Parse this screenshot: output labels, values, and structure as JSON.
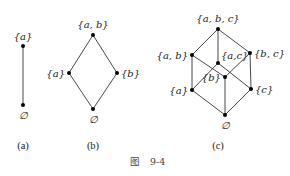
{
  "figure": {
    "caption_prefix": "图",
    "caption_number": "9-4"
  },
  "diagrams": [
    {
      "id": "a",
      "caption": "(a)",
      "nodes": [
        {
          "id": "a",
          "label": "{a}",
          "x": 23,
          "y": 46
        },
        {
          "id": "empty",
          "label": "∅",
          "x": 23,
          "y": 105
        }
      ],
      "edges": [
        [
          "a",
          "empty"
        ]
      ]
    },
    {
      "id": "b",
      "caption": "(b)",
      "nodes": [
        {
          "id": "ab",
          "label": "{a, b}",
          "x": 93,
          "y": 35
        },
        {
          "id": "a",
          "label": "{a}",
          "x": 69,
          "y": 73
        },
        {
          "id": "b",
          "label": "{b}",
          "x": 117,
          "y": 73
        },
        {
          "id": "empty",
          "label": "∅",
          "x": 93,
          "y": 109
        }
      ],
      "edges": [
        [
          "ab",
          "a"
        ],
        [
          "ab",
          "b"
        ],
        [
          "a",
          "empty"
        ],
        [
          "b",
          "empty"
        ]
      ]
    },
    {
      "id": "c",
      "caption": "(c)",
      "nodes": [
        {
          "id": "abc",
          "label": "{a, b, c}",
          "x": 218,
          "y": 29
        },
        {
          "id": "ab",
          "label": "{a, b}",
          "x": 192,
          "y": 55
        },
        {
          "id": "ac",
          "label": "{a,c}",
          "x": 218,
          "y": 63
        },
        {
          "id": "bc",
          "label": "{b, c}",
          "x": 250,
          "y": 53
        },
        {
          "id": "b",
          "label": "{b}",
          "x": 225,
          "y": 77
        },
        {
          "id": "a",
          "label": "{a}",
          "x": 192,
          "y": 90
        },
        {
          "id": "c",
          "label": "{c}",
          "x": 251,
          "y": 89
        },
        {
          "id": "empty",
          "label": "∅",
          "x": 225,
          "y": 115
        }
      ],
      "edges": [
        [
          "abc",
          "ab"
        ],
        [
          "abc",
          "ac"
        ],
        [
          "abc",
          "bc"
        ],
        [
          "ab",
          "a"
        ],
        [
          "ab",
          "b"
        ],
        [
          "ac",
          "a"
        ],
        [
          "ac",
          "c"
        ],
        [
          "bc",
          "b"
        ],
        [
          "bc",
          "c"
        ],
        [
          "a",
          "empty"
        ],
        [
          "b",
          "empty"
        ],
        [
          "c",
          "empty"
        ]
      ]
    }
  ]
}
